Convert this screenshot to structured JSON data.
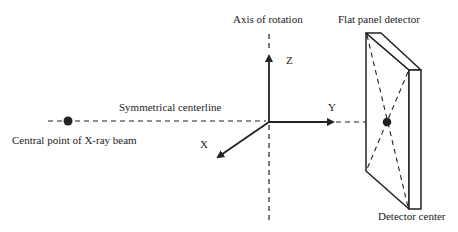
{
  "diagram": {
    "labels": {
      "axis_of_rotation": "Axis of rotation",
      "flat_panel_detector": "Flat panel detector",
      "symmetrical_centerline": "Symmetrical centerline",
      "central_point": "Central point of X-ray beam",
      "detector_center": "Detector center",
      "axis_z": "Z",
      "axis_y": "Y",
      "axis_x": "X"
    },
    "colors": {
      "stroke": "#222222",
      "background": "#ffffff"
    }
  }
}
